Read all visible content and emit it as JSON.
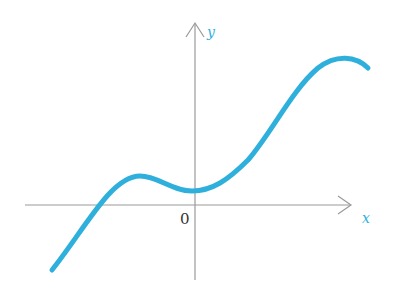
{
  "diagram": {
    "type": "function-graph",
    "x_axis_label": "x",
    "y_axis_label": "y",
    "origin_label": "0",
    "colors": {
      "curve": "#2fb0dc",
      "axis": "#9a9a9a",
      "axis_label": "#2fb0dc",
      "origin_label": "#333333"
    },
    "curve_features": [
      "crosses x-axis left of origin",
      "local maximum left of y-axis",
      "local minimum near y-axis above x-axis",
      "increases to maximum in upper right then turns down"
    ]
  }
}
